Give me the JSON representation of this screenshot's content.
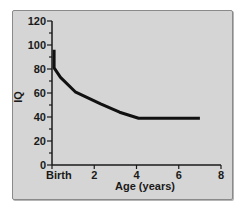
{
  "chart_data": {
    "type": "line",
    "title": "",
    "xlabel": "Age (years)",
    "ylabel": "IQ",
    "xlim": [
      0,
      8
    ],
    "ylim": [
      0,
      120
    ],
    "x_ticks": [
      0,
      2,
      4,
      6,
      8
    ],
    "x_tick_labels": [
      "Birth",
      "2",
      "4",
      "6",
      "8"
    ],
    "y_ticks": [
      0,
      20,
      40,
      60,
      80,
      100,
      120
    ],
    "y_tick_labels": [
      "0",
      "20",
      "40",
      "60",
      "80",
      "100",
      "120"
    ],
    "y_minor_step": 10,
    "grid": false,
    "legend": null,
    "series": [
      {
        "name": "IQ over age",
        "color": "#111111",
        "x": [
          0.1,
          0.1,
          0.4,
          1.1,
          2.3,
          3.2,
          4.1,
          7.0
        ],
        "y": [
          96,
          81,
          73,
          61,
          51,
          44,
          39,
          39
        ]
      }
    ]
  },
  "colors": {
    "panel_bg": "#d5d5d5",
    "panel_border": "#8a8a8a",
    "axis": "#1a1a1a",
    "line": "#111111"
  }
}
